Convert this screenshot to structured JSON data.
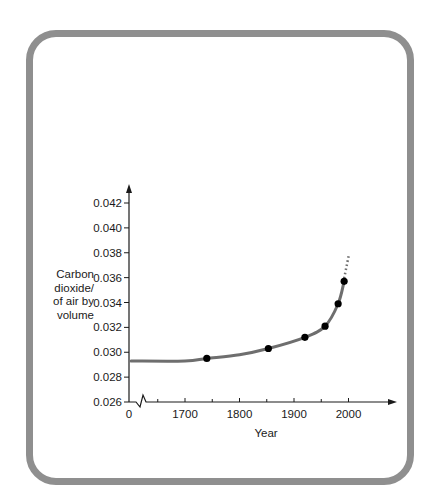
{
  "chart_data": {
    "type": "line",
    "title": "",
    "xlabel": "Year",
    "ylabel": "Carbon dioxide/ of air by volume",
    "ylabel_lines": [
      "Carbon",
      "dioxide/",
      "of air by",
      "volume"
    ],
    "x_ticks": [
      "0",
      "1700",
      "1800",
      "1900",
      "2000"
    ],
    "x_axis_break": true,
    "y_ticks": [
      "0.026",
      "0.028",
      "0.030",
      "0.032",
      "0.034",
      "0.036",
      "0.038",
      "0.040",
      "0.042"
    ],
    "ylim": [
      0.026,
      0.043
    ],
    "xlim": [
      1620,
      2085
    ],
    "grid": false,
    "legend": null,
    "series": [
      {
        "name": "CO2 concentration (measured points)",
        "x": [
          1740,
          1853,
          1920,
          1957,
          1981,
          1992
        ],
        "y": [
          0.0295,
          0.0303,
          0.0312,
          0.0321,
          0.0339,
          0.0357
        ]
      },
      {
        "name": "Fitted curve",
        "x": [
          1652,
          1700,
          1740,
          1800,
          1853,
          1920,
          1957,
          1981,
          1992
        ],
        "y": [
          0.0293,
          0.0293,
          0.0295,
          0.0298,
          0.0303,
          0.0312,
          0.0321,
          0.0339,
          0.0357
        ]
      },
      {
        "name": "Projection (dotted)",
        "x": [
          1992,
          2001
        ],
        "y": [
          0.0357,
          0.0379
        ]
      }
    ]
  },
  "colors": {
    "frame": "#8f8f8f",
    "curve": "#6e6e6e",
    "points": "#000000",
    "axis": "#1a1a1a"
  }
}
